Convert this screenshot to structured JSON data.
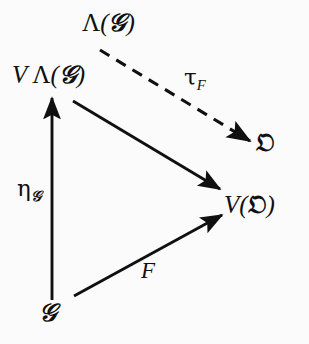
{
  "figure": {
    "kind": "commutative-diagram",
    "background_color": "#fbfbfb",
    "ink_color": "#101010",
    "width": 309,
    "height": 344
  },
  "nodes": [
    {
      "id": "lambda-g",
      "label": "Λ(𝐢)",
      "text": "Λ(𝒢)",
      "x": 118,
      "y": 23
    },
    {
      "id": "v-lambda-g",
      "label": "VΛ(𝒢)",
      "text": "V Λ(𝒢)",
      "x": 62,
      "y": 75
    },
    {
      "id": "omega",
      "label": "𝔒",
      "text": "𝔒",
      "x": 266,
      "y": 143
    },
    {
      "id": "v-omega",
      "label": "V(𝔒)",
      "text": "V(𝔒)",
      "x": 262,
      "y": 205
    },
    {
      "id": "g",
      "label": "𝒢",
      "text": "𝒢",
      "x": 50,
      "y": 313
    }
  ],
  "labels": {
    "lambda_g": {
      "lambda": "Λ",
      "open": "(",
      "script_g": "𝒢",
      "close": ")"
    },
    "v_lambda_g": {
      "v": "V",
      "lambda": "Λ",
      "open": "(",
      "script_g": "𝒢",
      "close": ")"
    },
    "omega": {
      "fraktur_o": "𝔒"
    },
    "v_omega": {
      "v": "V",
      "open": "(",
      "fraktur_o": "𝔒",
      "close": ")"
    },
    "g": {
      "script_g": "𝒢"
    }
  },
  "edges": [
    {
      "id": "tau-f",
      "from": "lambda-g",
      "to": "omega",
      "style": "dashed",
      "label_base": "τ",
      "label_sub": "F",
      "label_x": 184,
      "label_y": 66,
      "x1": 100,
      "y1": 50,
      "x2": 250,
      "y2": 141
    },
    {
      "id": "eta-g",
      "from": "g",
      "to": "v-lambda-g",
      "style": "solid",
      "label_base": "η",
      "label_sub": "𝒢",
      "label_x": 17,
      "label_y": 177,
      "x1": 52,
      "y1": 300,
      "x2": 52,
      "y2": 96
    },
    {
      "id": "v-eta",
      "from": "v-lambda-g",
      "to": "v-omega",
      "style": "solid",
      "label_base": "",
      "label_sub": "",
      "x1": 73,
      "y1": 101,
      "x2": 221,
      "y2": 190
    },
    {
      "id": "f",
      "from": "g",
      "to": "v-omega",
      "style": "solid",
      "label_base": "F",
      "label_sub": "",
      "label_x": 141,
      "label_y": 259,
      "x1": 74,
      "y1": 296,
      "x2": 223,
      "y2": 214
    }
  ]
}
